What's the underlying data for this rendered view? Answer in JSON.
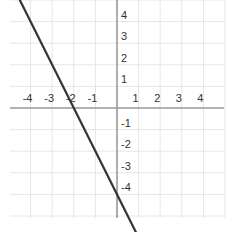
{
  "chart_data": {
    "type": "line",
    "title": "",
    "xlabel": "",
    "ylabel": "",
    "xlim": [
      -5,
      5
    ],
    "ylim": [
      -5,
      5
    ],
    "grid": true,
    "x_ticks": [
      -4,
      -3,
      -2,
      -1,
      1,
      2,
      3,
      4
    ],
    "y_ticks": [
      4,
      3,
      2,
      1,
      -1,
      -2,
      -3,
      -4
    ],
    "x_tick_labels": [
      "-4",
      "-3",
      "-2",
      "-1",
      "1",
      "2",
      "3",
      "4"
    ],
    "y_tick_labels": [
      "4",
      "3",
      "2",
      "1",
      "-1",
      "-2",
      "-3",
      "-4"
    ],
    "series": [
      {
        "name": "line",
        "equation": "y = -2x - 4",
        "x": [
          -4.6,
          1.2
        ],
        "y": [
          5.2,
          -6.4
        ],
        "x_intercept": -2,
        "y_intercept": -4,
        "color": "#333333"
      }
    ]
  },
  "colors": {
    "grid": "#e6e6e6",
    "axis": "#999999",
    "line": "#333333",
    "tick_text": "#333333"
  }
}
